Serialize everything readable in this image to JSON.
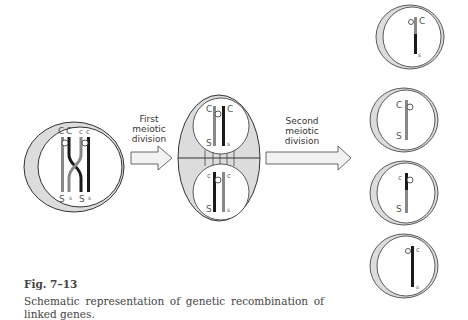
{
  "figure": {
    "number": "Fig. 7–13",
    "caption": "Schematic representation of genetic recombination of linked genes."
  },
  "arrows": {
    "first": [
      "First",
      "meiotic",
      "division"
    ],
    "second": [
      "Second",
      "meiotic",
      "division"
    ]
  },
  "parent_cell": {
    "top_labels": [
      "C",
      "C",
      "c",
      "c"
    ],
    "bottom_labels": [
      "S",
      "s",
      "S",
      "s"
    ]
  },
  "dividing_cell": {
    "top_nucleus": {
      "top_labels": [
        "C",
        "C"
      ],
      "bottom_labels": [
        "S",
        "s"
      ]
    },
    "bottom_nucleus": {
      "top_labels": [
        "c",
        "c"
      ],
      "bottom_labels": [
        "S",
        "s"
      ]
    }
  },
  "gametes": [
    {
      "top": "C",
      "bottom": "s"
    },
    {
      "top": "C",
      "bottom": "S"
    },
    {
      "top": "c",
      "bottom": "S"
    },
    {
      "top": "c",
      "bottom": "s"
    }
  ],
  "colors": {
    "cytoplasm": "#dcdcdc",
    "outline": "#333333",
    "chromosome_dark": "#1a1a1a",
    "chromosome_gray": "#888888"
  }
}
